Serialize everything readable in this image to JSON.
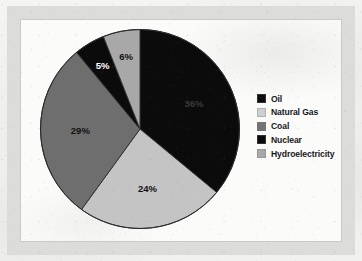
{
  "figure": {
    "background_color": "#f2f2f0",
    "frame_color": "#dcdcda",
    "plot_background_color": "#fbfbfa",
    "plot_border_color": "#c9c9c7"
  },
  "chart_data": {
    "type": "pie",
    "title": "",
    "subtitle": "",
    "xlabel": "",
    "ylabel": "",
    "grid": false,
    "legend_position": "right",
    "start_angle_oclock": 12,
    "direction": "clockwise",
    "total": 100,
    "unit": "%",
    "categories": [
      "Oil",
      "Natural Gas",
      "Coal",
      "Nuclear",
      "Hydroelectricity"
    ],
    "values": [
      36,
      24,
      29,
      5,
      6
    ],
    "data_labels": [
      "36%",
      "24%",
      "29%",
      "5%",
      "6%"
    ],
    "slice_colors": [
      "#0b0b0b",
      "#c4c4c4",
      "#6e6e6e",
      "#0b0b0b",
      "#a8a8a8"
    ],
    "slice_label_colors": [
      "#3a3a3a",
      "#111111",
      "#111111",
      "#ffffff",
      "#111111"
    ],
    "slices": [
      {
        "name": "Oil",
        "value": 36,
        "label": "36%",
        "color": "#0b0b0b",
        "label_color": "#3a3a3a"
      },
      {
        "name": "Natural Gas",
        "value": 24,
        "label": "24%",
        "color": "#c4c4c4",
        "label_color": "#111111"
      },
      {
        "name": "Coal",
        "value": 29,
        "label": "29%",
        "color": "#6e6e6e",
        "label_color": "#111111"
      },
      {
        "name": "Nuclear",
        "value": 5,
        "label": "5%",
        "color": "#0b0b0b",
        "label_color": "#ffffff"
      },
      {
        "name": "Hydroelectricity",
        "value": 6,
        "label": "6%",
        "color": "#a8a8a8",
        "label_color": "#111111"
      }
    ]
  },
  "legend": {
    "items": [
      {
        "label": "Oil",
        "color": "#0b0b0b"
      },
      {
        "label": "Natural Gas",
        "color": "#cfcfcf"
      },
      {
        "label": "Coal",
        "color": "#737373"
      },
      {
        "label": "Nuclear",
        "color": "#0b0b0b"
      },
      {
        "label": "Hydroelectricity",
        "color": "#a8a8a8"
      }
    ]
  }
}
